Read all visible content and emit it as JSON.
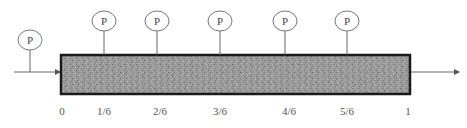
{
  "diagram": {
    "probe_label": "P",
    "inlet_probe": {
      "label": "P",
      "cx": 30,
      "cy": 40
    },
    "probes": [
      {
        "label": "P",
        "position": "1/6",
        "cx": 104
      },
      {
        "label": "P",
        "position": "2/6",
        "cx": 157
      },
      {
        "label": "P",
        "position": "3/6",
        "cx": 220
      },
      {
        "label": "P",
        "position": "4/6",
        "cx": 285
      },
      {
        "label": "P",
        "position": "5/6",
        "cx": 347
      }
    ],
    "axis_labels": [
      {
        "text": "0",
        "x": 62
      },
      {
        "text": "1/6",
        "x": 104
      },
      {
        "text": "2/6",
        "x": 160
      },
      {
        "text": "3/6",
        "x": 220
      },
      {
        "text": "4/6",
        "x": 289
      },
      {
        "text": "5/6",
        "x": 347
      },
      {
        "text": "1",
        "x": 408
      }
    ],
    "colors": {
      "line": "#555555",
      "bed_border": "#1a1a1a",
      "bed_fill": "#8a8a8a"
    }
  }
}
